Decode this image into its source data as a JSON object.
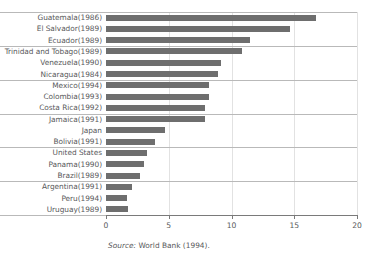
{
  "chart_data": {
    "type": "bar",
    "orientation": "horizontal",
    "title": "",
    "xlabel": "",
    "ylabel": "",
    "xlim": [
      0,
      20
    ],
    "xticks": [
      0,
      5,
      10,
      15,
      20
    ],
    "xtick_labels": [
      "0",
      "5",
      "10",
      "15",
      "20"
    ],
    "grid": true,
    "legend": null,
    "bar_color": "#6e6e6e",
    "categories": [
      "Guatemala(1986)",
      "El Salvador(1989)",
      "Ecuador(1989)",
      "Trinidad and Tobago(1989)",
      "Venezuela(1990)",
      "Nicaragua(1984)",
      "Mexico(1994)",
      "Colombia(1993)",
      "Costa Rica(1992)",
      "Jamaica(1991)",
      "Japan",
      "Bolivia(1991)",
      "United States",
      "Panama(1990)",
      "Brazil(1989)",
      "Argentina(1991)",
      "Peru(1994)",
      "Uruguay(1989)"
    ],
    "values": [
      16.7,
      14.7,
      11.5,
      10.8,
      9.2,
      8.9,
      8.2,
      8.2,
      7.9,
      7.9,
      4.7,
      3.9,
      3.3,
      3.0,
      2.7,
      2.1,
      1.7,
      1.75
    ],
    "source": {
      "label": "Source:",
      "text": "World Bank (1994)."
    }
  },
  "figure": {
    "source_label": "Source:",
    "source_text": "World Bank (1994)."
  }
}
